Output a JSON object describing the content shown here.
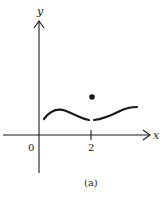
{
  "figure": {
    "axis_labels": {
      "x": "x",
      "y": "y"
    },
    "tick_labels": {
      "origin": "0",
      "x_tick": "2"
    },
    "caption": "(a)",
    "colors": {
      "ink": "#1a1a1a",
      "background": "#ffffff"
    }
  },
  "function_graph": {
    "description": "Curve with removable discontinuity at x = 2; open gap in curve, filled point above",
    "discontinuity_x": "2",
    "point": "filled dot above the gap at x = 2"
  }
}
